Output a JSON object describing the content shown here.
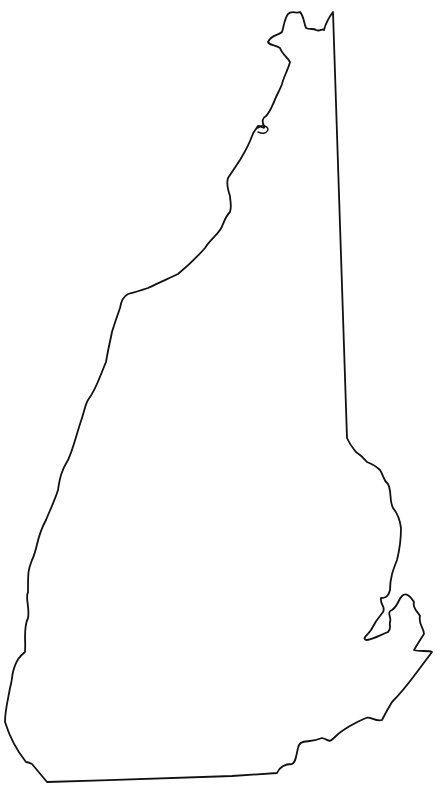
{
  "map": {
    "title": "",
    "subject": "New Hampshire state outline",
    "background_color": "#ffffff",
    "stroke_color": "#111111",
    "stroke_width": 1.8,
    "labels": []
  }
}
